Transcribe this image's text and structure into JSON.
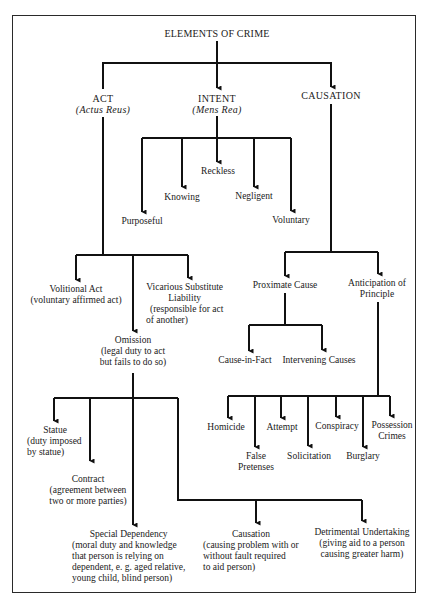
{
  "diagram": {
    "title": "ELEMENTS OF CRIME",
    "colors": {
      "line": "#111111",
      "frame": "#2a2a2a",
      "text": "#1a1a1a",
      "background": "#ffffff"
    },
    "level1": {
      "act": {
        "label": "ACT",
        "sub": "(Actus Reus)"
      },
      "intent": {
        "label": "INTENT",
        "sub": "(Mens Rea)"
      },
      "causation": {
        "label": "CAUSATION"
      }
    },
    "intent_types": [
      {
        "label": "Purposeful"
      },
      {
        "label": "Knowing"
      },
      {
        "label": "Reckless"
      },
      {
        "label": "Negligent"
      },
      {
        "label": "Voluntary"
      }
    ],
    "act_types": {
      "volitional": {
        "label": "Volitional Act",
        "sub": "(voluntary affirmed act)"
      },
      "vicarious": {
        "label": "Vicarious Substitute",
        "line2": "Liability",
        "sub1": "(responsible for act",
        "sub2": "of another)"
      },
      "omission": {
        "label": "Omission",
        "sub1": "(legal duty to act",
        "sub2": "but fails to do so)"
      }
    },
    "omission_types": {
      "statue": {
        "label": "Statue",
        "sub1": "(duty imposed",
        "sub2": "by statue)"
      },
      "contract": {
        "label": "Contract",
        "sub1": "(agreement between",
        "sub2": "two or more parties)"
      },
      "special_dependency": {
        "label": "Special Dependency",
        "sub1": "(moral duty and knowledge",
        "sub2": "that person is relying on",
        "sub3": "dependent, e. g. aged relative,",
        "sub4": "young child, blind person)"
      },
      "causation": {
        "label": "Causation",
        "sub1": "(causing problem with or",
        "sub2": "without fault required",
        "sub3": "to aid person)"
      },
      "detrimental": {
        "label": "Detrimental Undertaking",
        "sub1": "(giving aid to a person",
        "sub2": "causing greater harm)"
      }
    },
    "causation_types": {
      "proximate": {
        "label": "Proximate Cause"
      },
      "anticipation": {
        "label": "Anticipation of",
        "line2": "Principle"
      }
    },
    "proximate_types": [
      {
        "label": "Cause-in-Fact"
      },
      {
        "label": "Intervening Causes"
      }
    ],
    "crime_types": {
      "homicide": {
        "label": "Homicide"
      },
      "false_pretenses": {
        "label": "False",
        "line2": "Pretenses"
      },
      "attempt": {
        "label": "Attempt"
      },
      "solicitation": {
        "label": "Solicitation"
      },
      "conspiracy": {
        "label": "Conspiracy"
      },
      "burglary": {
        "label": "Burglary"
      },
      "possession": {
        "label": "Possession",
        "line2": "Crimes"
      }
    }
  }
}
